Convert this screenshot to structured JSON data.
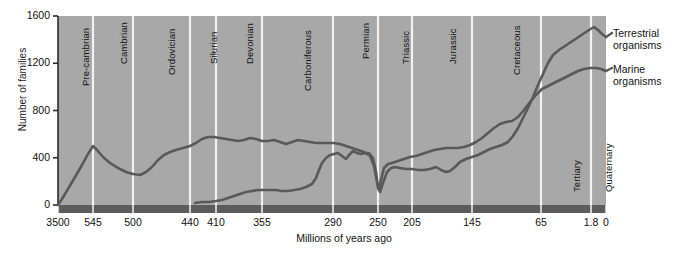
{
  "chart_data": {
    "type": "line",
    "title": "",
    "xlabel": "Millions of years ago",
    "ylabel": "Number of families",
    "xticks": [
      "3500",
      "545",
      "500",
      "440",
      "410",
      "355",
      "290",
      "250",
      "205",
      "145",
      "65",
      "1.8",
      "0"
    ],
    "xtick_values": [
      3500,
      545,
      500,
      440,
      410,
      355,
      290,
      250,
      205,
      145,
      65,
      1.8,
      0
    ],
    "xtick_px": [
      58,
      93,
      133,
      190,
      216,
      262,
      333,
      378,
      412,
      472,
      541,
      591,
      606
    ],
    "yticks": [
      "0",
      "400",
      "800",
      "1200",
      "1600"
    ],
    "ytick_values": [
      0,
      400,
      800,
      1200,
      1600
    ],
    "ylim": [
      0,
      1600
    ],
    "grid": "vertical-period-dividers",
    "legend_position": "right",
    "axis_direction": "reversed-time",
    "periods": [
      {
        "label": "Pre-cambrian",
        "start_ma": 3500,
        "end_ma": 545
      },
      {
        "label": "Cambrian",
        "start_ma": 545,
        "end_ma": 500
      },
      {
        "label": "Ordovician",
        "start_ma": 500,
        "end_ma": 440
      },
      {
        "label": "Silurian",
        "start_ma": 440,
        "end_ma": 410
      },
      {
        "label": "Devonian",
        "start_ma": 410,
        "end_ma": 355
      },
      {
        "label": "Carboniferous",
        "start_ma": 355,
        "end_ma": 290
      },
      {
        "label": "Permian",
        "start_ma": 290,
        "end_ma": 250
      },
      {
        "label": "Triassic",
        "start_ma": 250,
        "end_ma": 205
      },
      {
        "label": "Jurassic",
        "start_ma": 205,
        "end_ma": 145
      },
      {
        "label": "Cretaceous",
        "start_ma": 145,
        "end_ma": 65
      },
      {
        "label": "Tertiary",
        "start_ma": 65,
        "end_ma": 1.8
      },
      {
        "label": "Quaternary",
        "start_ma": 1.8,
        "end_ma": 0
      }
    ],
    "series": [
      {
        "name": "Marine organisms",
        "legend_label_line1": "Marine",
        "legend_label_line2": "organisms",
        "color": "#595959",
        "points": [
          [
            58,
            205
          ],
          [
            62,
            199
          ],
          [
            68,
            189
          ],
          [
            75,
            177
          ],
          [
            82,
            165
          ],
          [
            88,
            154
          ],
          [
            93,
            146
          ],
          [
            97,
            150
          ],
          [
            103,
            157
          ],
          [
            110,
            163
          ],
          [
            118,
            168
          ],
          [
            126,
            172
          ],
          [
            133,
            174
          ],
          [
            140,
            175
          ],
          [
            146,
            172
          ],
          [
            152,
            167
          ],
          [
            158,
            160
          ],
          [
            164,
            155
          ],
          [
            170,
            152
          ],
          [
            176,
            150
          ],
          [
            183,
            148
          ],
          [
            190,
            146
          ],
          [
            196,
            143
          ],
          [
            202,
            139
          ],
          [
            208,
            137
          ],
          [
            214,
            137
          ],
          [
            220,
            138
          ],
          [
            226,
            139
          ],
          [
            232,
            140
          ],
          [
            238,
            141
          ],
          [
            244,
            140
          ],
          [
            250,
            138
          ],
          [
            256,
            139
          ],
          [
            262,
            141
          ],
          [
            268,
            141
          ],
          [
            274,
            140
          ],
          [
            280,
            142
          ],
          [
            286,
            144
          ],
          [
            292,
            142
          ],
          [
            298,
            140
          ],
          [
            304,
            141
          ],
          [
            310,
            142
          ],
          [
            316,
            143
          ],
          [
            322,
            143
          ],
          [
            328,
            143
          ],
          [
            334,
            143
          ],
          [
            340,
            144
          ],
          [
            346,
            146
          ],
          [
            352,
            148
          ],
          [
            358,
            150
          ],
          [
            364,
            152
          ],
          [
            370,
            156
          ],
          [
            374,
            166
          ],
          [
            377,
            182
          ],
          [
            379,
            190
          ],
          [
            381,
            180
          ],
          [
            384,
            168
          ],
          [
            388,
            164
          ],
          [
            392,
            163
          ],
          [
            398,
            161
          ],
          [
            404,
            159
          ],
          [
            410,
            157
          ],
          [
            416,
            156
          ],
          [
            422,
            154
          ],
          [
            428,
            152
          ],
          [
            434,
            150
          ],
          [
            440,
            149
          ],
          [
            446,
            148
          ],
          [
            452,
            148
          ],
          [
            458,
            148
          ],
          [
            464,
            147
          ],
          [
            470,
            145
          ],
          [
            476,
            142
          ],
          [
            482,
            138
          ],
          [
            488,
            133
          ],
          [
            494,
            128
          ],
          [
            500,
            124
          ],
          [
            506,
            122
          ],
          [
            512,
            121
          ],
          [
            518,
            117
          ],
          [
            524,
            110
          ],
          [
            530,
            102
          ],
          [
            536,
            95
          ],
          [
            542,
            89
          ],
          [
            548,
            86
          ],
          [
            554,
            83
          ],
          [
            560,
            80
          ],
          [
            566,
            77
          ],
          [
            572,
            74
          ],
          [
            578,
            71
          ],
          [
            584,
            69
          ],
          [
            590,
            68
          ],
          [
            596,
            68
          ],
          [
            601,
            69
          ],
          [
            606,
            71
          ]
        ]
      },
      {
        "name": "Terrestrial organisms",
        "legend_label_line1": "Terrestrial",
        "legend_label_line2": "organisms",
        "color": "#595959",
        "points": [
          [
            195,
            203
          ],
          [
            202,
            202
          ],
          [
            209,
            202
          ],
          [
            216,
            201
          ],
          [
            222,
            200
          ],
          [
            228,
            198
          ],
          [
            234,
            196
          ],
          [
            240,
            194
          ],
          [
            246,
            192
          ],
          [
            252,
            191
          ],
          [
            258,
            190
          ],
          [
            264,
            190
          ],
          [
            270,
            190
          ],
          [
            276,
            190
          ],
          [
            282,
            191
          ],
          [
            288,
            191
          ],
          [
            294,
            190
          ],
          [
            300,
            189
          ],
          [
            306,
            187
          ],
          [
            312,
            184
          ],
          [
            316,
            178
          ],
          [
            319,
            170
          ],
          [
            322,
            163
          ],
          [
            326,
            158
          ],
          [
            330,
            155
          ],
          [
            334,
            154
          ],
          [
            338,
            153
          ],
          [
            342,
            156
          ],
          [
            346,
            159
          ],
          [
            349,
            155
          ],
          [
            353,
            151
          ],
          [
            357,
            153
          ],
          [
            361,
            154
          ],
          [
            365,
            153
          ],
          [
            369,
            153
          ],
          [
            373,
            158
          ],
          [
            376,
            172
          ],
          [
            378,
            188
          ],
          [
            380,
            192
          ],
          [
            383,
            183
          ],
          [
            387,
            172
          ],
          [
            391,
            168
          ],
          [
            395,
            167
          ],
          [
            400,
            168
          ],
          [
            406,
            169
          ],
          [
            412,
            169
          ],
          [
            418,
            170
          ],
          [
            424,
            170
          ],
          [
            430,
            169
          ],
          [
            436,
            167
          ],
          [
            441,
            170
          ],
          [
            446,
            172
          ],
          [
            450,
            171
          ],
          [
            455,
            167
          ],
          [
            460,
            162
          ],
          [
            466,
            159
          ],
          [
            472,
            157
          ],
          [
            478,
            155
          ],
          [
            484,
            152
          ],
          [
            490,
            149
          ],
          [
            496,
            147
          ],
          [
            502,
            145
          ],
          [
            508,
            142
          ],
          [
            513,
            136
          ],
          [
            518,
            128
          ],
          [
            523,
            118
          ],
          [
            528,
            108
          ],
          [
            533,
            97
          ],
          [
            538,
            85
          ],
          [
            543,
            74
          ],
          [
            548,
            63
          ],
          [
            553,
            55
          ],
          [
            559,
            50
          ],
          [
            565,
            46
          ],
          [
            571,
            42
          ],
          [
            577,
            38
          ],
          [
            583,
            34
          ],
          [
            589,
            30
          ],
          [
            594,
            27
          ],
          [
            598,
            30
          ],
          [
            602,
            34
          ],
          [
            606,
            37
          ]
        ]
      }
    ]
  },
  "axes": {
    "ylabel": "Number of families",
    "xlabel": "Millions of years ago"
  },
  "colors": {
    "plot_background": "#a8a8a8",
    "divider": "#f2f2f2",
    "line": "#595959",
    "axis_bar": "#5c5c5c",
    "text": "#111111",
    "page_background": "#ffffff"
  }
}
